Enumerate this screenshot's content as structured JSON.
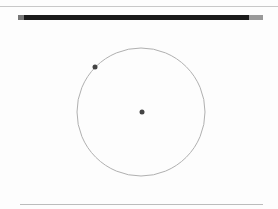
{
  "window": {
    "title": ""
  },
  "canvas": {
    "circle": {
      "cx": 141,
      "cy": 112,
      "r": 64,
      "stroke": "#b0b0b0"
    },
    "center_point": {
      "x": 142,
      "y": 112,
      "r": 2.5,
      "fill": "#444444"
    },
    "edge_point": {
      "x": 95,
      "y": 67,
      "r": 2.5,
      "fill": "#444444"
    }
  }
}
